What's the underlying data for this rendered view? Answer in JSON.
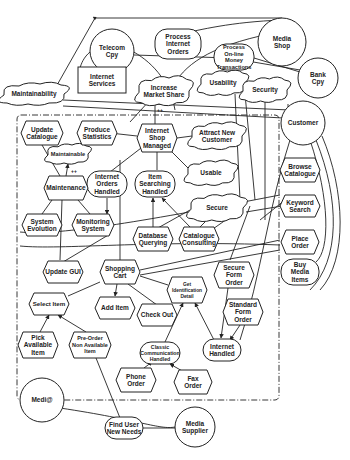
{
  "diagram": {
    "type": "i* strategic rationale model",
    "boundary_actor": "Medi@",
    "actors": [
      {
        "id": "telecom",
        "label": [
          "Telecom",
          "Cpy"
        ],
        "x": 112,
        "y": 51,
        "r": 22
      },
      {
        "id": "mediashop",
        "label": [
          "Media",
          "Shop"
        ],
        "x": 282,
        "y": 42,
        "r": 24
      },
      {
        "id": "bankcpy",
        "label": [
          "Bank",
          "Cpy"
        ],
        "x": 318,
        "y": 78,
        "r": 20
      },
      {
        "id": "customer",
        "label": [
          "Customer"
        ],
        "x": 303,
        "y": 123,
        "r": 22
      },
      {
        "id": "medi",
        "label": [
          "Medi@"
        ],
        "x": 42,
        "y": 400,
        "r": 22
      },
      {
        "id": "supplier",
        "label": [
          "Media",
          "Supplier"
        ],
        "x": 195,
        "y": 427,
        "r": 20
      }
    ],
    "softgoals": [
      {
        "id": "maintainability",
        "label": [
          "Maintainability"
        ],
        "x": 34,
        "y": 94,
        "w": 60,
        "h": 20
      },
      {
        "id": "increase_market",
        "label": [
          "Increase",
          "Market Share"
        ],
        "x": 164,
        "y": 91,
        "w": 50,
        "h": 26
      },
      {
        "id": "usability",
        "label": [
          "Usability"
        ],
        "x": 223,
        "y": 83,
        "w": 44,
        "h": 22
      },
      {
        "id": "security",
        "label": [
          "Security"
        ],
        "x": 265,
        "y": 90,
        "w": 44,
        "h": 22
      },
      {
        "id": "maintainable",
        "label": [
          "Maintainable"
        ],
        "x": 68,
        "y": 154,
        "w": 40,
        "h": 18
      },
      {
        "id": "attract",
        "label": [
          "Attract New",
          "Customer"
        ],
        "x": 217,
        "y": 136,
        "w": 50,
        "h": 24
      },
      {
        "id": "usable",
        "label": [
          "Usable"
        ],
        "x": 211,
        "y": 173,
        "w": 46,
        "h": 22
      },
      {
        "id": "secure",
        "label": [
          "Secure"
        ],
        "x": 217,
        "y": 208,
        "w": 52,
        "h": 24
      }
    ],
    "goals": [
      {
        "id": "process_internet",
        "label": [
          "Process",
          "Internet",
          "Orders"
        ],
        "x": 178,
        "y": 44,
        "w": 46,
        "h": 30
      },
      {
        "id": "process_money",
        "label": [
          "Process",
          "On-line",
          "Money",
          "Transactions"
        ],
        "x": 234,
        "y": 57,
        "w": 40,
        "h": 26
      },
      {
        "id": "internet_orders_handled",
        "label": [
          "Internet",
          "Orders",
          "Handled"
        ],
        "x": 107,
        "y": 184,
        "w": 40,
        "h": 26
      },
      {
        "id": "item_searching_handled",
        "label": [
          "Item",
          "Searching",
          "Handled"
        ],
        "x": 155,
        "y": 184,
        "w": 40,
        "h": 26
      },
      {
        "id": "buy_media",
        "label": [
          "Buy",
          "Media",
          "Items"
        ],
        "x": 300,
        "y": 272,
        "w": 38,
        "h": 26
      },
      {
        "id": "classic_comm",
        "label": [
          "Classic",
          "Communication",
          "Handled"
        ],
        "x": 160,
        "y": 353,
        "w": 40,
        "h": 22
      },
      {
        "id": "internet_handled",
        "label": [
          "Internet",
          "Handled"
        ],
        "x": 222,
        "y": 350,
        "w": 38,
        "h": 22
      },
      {
        "id": "find_user",
        "label": [
          "Find User",
          "New Needs"
        ],
        "x": 124,
        "y": 428,
        "w": 38,
        "h": 22
      }
    ],
    "resources": [
      {
        "id": "internet_services",
        "label": [
          "Internet",
          "Services"
        ],
        "x": 102,
        "y": 80,
        "w": 48,
        "h": 26
      }
    ],
    "tasks": [
      {
        "id": "update_catalogue",
        "label": [
          "Update",
          "Catalogue"
        ],
        "x": 42,
        "y": 133,
        "w": 42,
        "h": 24
      },
      {
        "id": "produce_statistics",
        "label": [
          "Produce",
          "Statistics"
        ],
        "x": 97,
        "y": 133,
        "w": 40,
        "h": 24
      },
      {
        "id": "internet_shop_managed",
        "label": [
          "Internet",
          "Shop",
          "Managed"
        ],
        "x": 157,
        "y": 138,
        "w": 40,
        "h": 28
      },
      {
        "id": "browse_catalogue",
        "label": [
          "Browse",
          "Catalogue"
        ],
        "x": 300,
        "y": 170,
        "w": 40,
        "h": 24
      },
      {
        "id": "maintenance",
        "label": [
          "Maintenance"
        ],
        "x": 66,
        "y": 188,
        "w": 44,
        "h": 24
      },
      {
        "id": "keyword_search",
        "label": [
          "Keyword",
          "Search"
        ],
        "x": 300,
        "y": 206,
        "w": 40,
        "h": 22
      },
      {
        "id": "system_evolution",
        "label": [
          "System",
          "Evolution"
        ],
        "x": 42,
        "y": 225,
        "w": 40,
        "h": 22
      },
      {
        "id": "monitoring_system",
        "label": [
          "Monitoring",
          "System"
        ],
        "x": 93,
        "y": 225,
        "w": 42,
        "h": 22
      },
      {
        "id": "database_querying",
        "label": [
          "Database",
          "Querying"
        ],
        "x": 153,
        "y": 239,
        "w": 40,
        "h": 24
      },
      {
        "id": "catalogue_consulting",
        "label": [
          "Catalogue",
          "Consulting"
        ],
        "x": 199,
        "y": 239,
        "w": 40,
        "h": 24
      },
      {
        "id": "place_order",
        "label": [
          "Place",
          "Order"
        ],
        "x": 300,
        "y": 242,
        "w": 38,
        "h": 24
      },
      {
        "id": "update_gui",
        "label": [
          "Update GUI"
        ],
        "x": 63,
        "y": 272,
        "w": 40,
        "h": 22
      },
      {
        "id": "shopping_cart",
        "label": [
          "Shopping",
          "Cart"
        ],
        "x": 120,
        "y": 272,
        "w": 40,
        "h": 24
      },
      {
        "id": "secure_form_order",
        "label": [
          "Secure",
          "Form",
          "Order"
        ],
        "x": 234,
        "y": 275,
        "w": 40,
        "h": 26
      },
      {
        "id": "get_identification",
        "label": [
          "Get",
          "Identification",
          "Detail"
        ],
        "x": 187,
        "y": 290,
        "w": 40,
        "h": 26
      },
      {
        "id": "select_item",
        "label": [
          "Select Item"
        ],
        "x": 49,
        "y": 304,
        "w": 40,
        "h": 22
      },
      {
        "id": "add_item",
        "label": [
          "Add Item"
        ],
        "x": 115,
        "y": 308,
        "w": 40,
        "h": 22
      },
      {
        "id": "standard_form_order",
        "label": [
          "Standard",
          "Form",
          "Order"
        ],
        "x": 243,
        "y": 312,
        "w": 40,
        "h": 26
      },
      {
        "id": "check_out",
        "label": [
          "Check Out"
        ],
        "x": 157,
        "y": 315,
        "w": 40,
        "h": 22
      },
      {
        "id": "pick_available",
        "label": [
          "Pick",
          "Available",
          "Item"
        ],
        "x": 38,
        "y": 345,
        "w": 40,
        "h": 26
      },
      {
        "id": "pre_order",
        "label": [
          "Pre-Order",
          "Non Available",
          "Item"
        ],
        "x": 90,
        "y": 345,
        "w": 42,
        "h": 26
      },
      {
        "id": "phone_order",
        "label": [
          "Phone",
          "Order"
        ],
        "x": 136,
        "y": 380,
        "w": 40,
        "h": 24
      },
      {
        "id": "fax_order",
        "label": [
          "Fax",
          "Order"
        ],
        "x": 193,
        "y": 382,
        "w": 38,
        "h": 24
      }
    ],
    "contribution_labels": [
      {
        "text": "++",
        "x": 160,
        "y": 112
      },
      {
        "text": "++",
        "x": 74,
        "y": 173
      }
    ],
    "boundary": {
      "x": 17,
      "y": 115,
      "w": 262,
      "h": 285
    }
  }
}
